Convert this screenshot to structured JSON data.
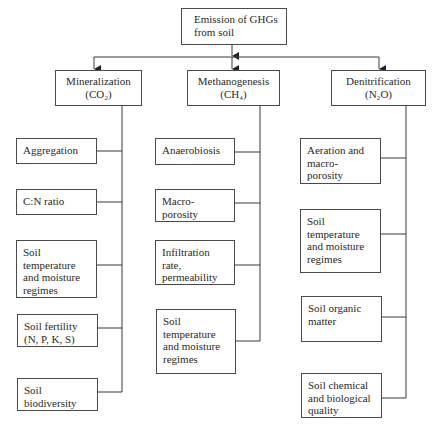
{
  "title": {
    "line1": "Emission of GHGs",
    "line2": "from soil"
  },
  "branches": [
    {
      "name": "Mineralization",
      "gas": "(CO₂)",
      "factors": [
        [
          "Aggregation"
        ],
        [
          "C:N ratio"
        ],
        [
          "Soil",
          "temperature",
          "and moisture",
          "regimes"
        ],
        [
          "Soil fertility",
          "(N, P, K, S)"
        ],
        [
          "Soil",
          "biodiversity"
        ]
      ]
    },
    {
      "name": "Methanogenesis",
      "gas": "(CH₄)",
      "factors": [
        [
          "Anaerobiosis"
        ],
        [
          "Macro-",
          "porosity"
        ],
        [
          "Infiltration",
          "rate,",
          "permeability"
        ],
        [
          "Soil",
          "temperature",
          "and moisture",
          "regimes"
        ]
      ]
    },
    {
      "name": "Denitrification",
      "gas": "(N₂O)",
      "factors": [
        [
          "Aeration and",
          "macro-",
          "porosity"
        ],
        [
          "Soil",
          "temperature",
          "and moisture",
          "regimes"
        ],
        [
          "Soil organic",
          "matter"
        ],
        [
          "Soil chemical",
          "and biological",
          "quality"
        ]
      ]
    }
  ],
  "colors": {
    "line": "#3a3a3a",
    "text": "#2a2a2a",
    "background": "#ffffff"
  }
}
